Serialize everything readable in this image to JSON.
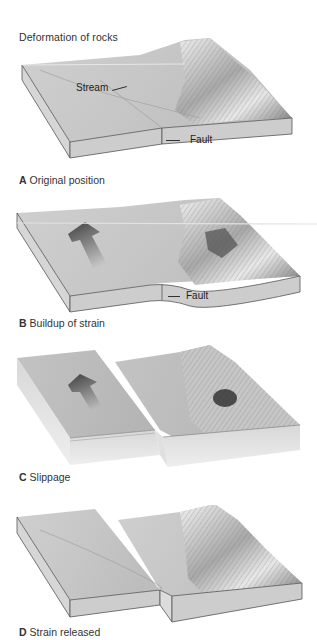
{
  "figure": {
    "title": "Deformation of rocks"
  },
  "panels": [
    {
      "letter": "A",
      "caption": "Original position",
      "callouts": {
        "stream": "Stream",
        "fault": "Fault"
      }
    },
    {
      "letter": "B",
      "caption": "Buildup of strain",
      "callouts": {
        "fault": "Fault"
      }
    },
    {
      "letter": "C",
      "caption": "Slippage"
    },
    {
      "letter": "D",
      "caption": "Strain released"
    }
  ],
  "colors": {
    "terrain_top": "#c9c9c9",
    "terrain_light": "#e6e6e6",
    "block_side": "#d2d2d2",
    "block_front": "#cfcfcf",
    "edge": "#555555",
    "arrow": "#4a4a4a"
  }
}
